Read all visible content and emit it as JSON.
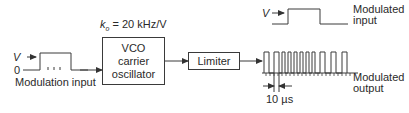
{
  "diagram": {
    "type": "block-diagram",
    "modulation_input": {
      "label": "Modulation input",
      "level_high": "V",
      "level_low": "0"
    },
    "vco": {
      "gain_label_prefix": "k",
      "gain_label_sub": "o",
      "gain_label_value": " = 20 kHz/V",
      "lines": [
        "VCO",
        "carrier",
        "oscillator"
      ]
    },
    "limiter": {
      "label": "Limiter"
    },
    "modulated_input": {
      "level": "V",
      "label_line1": "Modulated",
      "label_line2": "input"
    },
    "modulated_output": {
      "label_line1": "Modulated",
      "label_line2": "output",
      "period_label": "10 µs"
    },
    "colors": {
      "line": "#3a3a3a",
      "text": "#2a2a2a",
      "background": "#ffffff"
    }
  }
}
